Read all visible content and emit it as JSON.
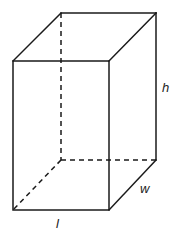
{
  "figure": {
    "type": "rectangular-prism",
    "width": 174,
    "height": 236,
    "vertices": {
      "front_top_left": [
        13,
        61
      ],
      "front_top_right": [
        109,
        61
      ],
      "front_bottom_left": [
        13,
        210
      ],
      "front_bottom_right": [
        109,
        210
      ],
      "back_top_left": [
        61,
        13
      ],
      "back_top_right": [
        156,
        13
      ],
      "back_bottom_left": [
        61,
        160
      ],
      "back_bottom_right": [
        156,
        160
      ]
    },
    "colors": {
      "stroke": "#1a1a1a",
      "label": "#222222",
      "background": "#ffffff"
    }
  },
  "labels": {
    "height": "h",
    "width": "w",
    "length": "l"
  }
}
